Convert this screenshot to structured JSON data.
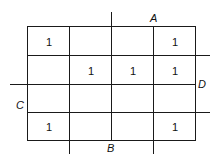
{
  "kmap": {
    "variables": [
      "A",
      "B",
      "C",
      "D"
    ],
    "labels": {
      "A": "A",
      "B": "B",
      "C": "C",
      "D": "D"
    },
    "grid": [
      [
        "1",
        "",
        "",
        "1"
      ],
      [
        "",
        "1",
        "1",
        "1"
      ],
      [
        "",
        "",
        "",
        ""
      ],
      [
        "1",
        "",
        "",
        "1"
      ]
    ]
  }
}
